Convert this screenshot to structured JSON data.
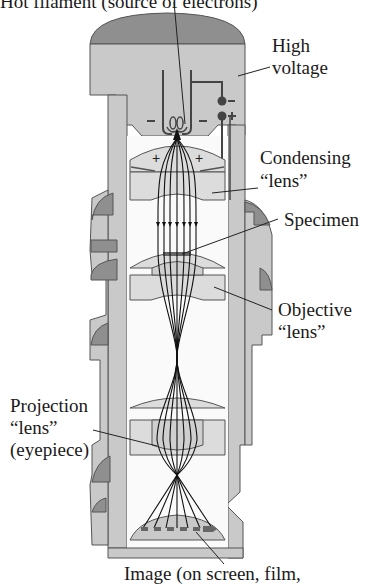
{
  "figure": {
    "colors": {
      "body_fill": "#c9c9c9",
      "dark_fill": "#8f8f8f",
      "lens_fill": "#dcdcdc",
      "outline": "#555555",
      "beam": "#111111"
    }
  },
  "labels": {
    "filament": "Hot filament (source of electrons)",
    "high_voltage_line1": "High",
    "high_voltage_line2": "voltage",
    "condensing_line1": "Condensing",
    "condensing_line2": "“lens”",
    "specimen": "Specimen",
    "objective_line1": "Objective",
    "objective_line2": "“lens”",
    "projection_line1": "Projection",
    "projection_line2": "“lens”",
    "projection_line3": "(eyepiece)",
    "image": "Image (on screen, film,"
  },
  "symbols": {
    "minus": "−",
    "plus": "+"
  }
}
